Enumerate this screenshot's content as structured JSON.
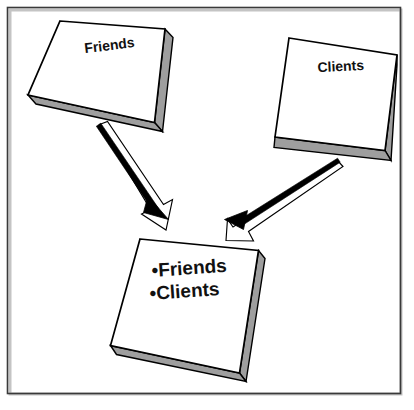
{
  "figure": {
    "type": "block-diagram",
    "title": "",
    "background_color": "#ffffff",
    "frame": {
      "name": "outer-border",
      "stroke_color": "#3a3a3a",
      "inner_shadow_color": "#bfbfbf",
      "x": 7,
      "y": 7,
      "width": 394,
      "height": 387
    },
    "style": {
      "box_face_color": "#ffffff",
      "box_side_color": "#9e9e9e",
      "box_outline_color": "#000000",
      "arrow_fill_color": "#ffffff",
      "arrow_line_color": "#000000",
      "arrowhead_color": "#000000",
      "text_color": "#111111"
    },
    "boxes": [
      {
        "id": "box-friends",
        "name": "box-friends",
        "label": "Friends",
        "label_rotation_deg": -7,
        "label_x": 110,
        "label_y": 50,
        "font_size": 14
      },
      {
        "id": "box-clients",
        "name": "box-clients",
        "label": "Clients",
        "label_rotation_deg": -3,
        "label_x": 341,
        "label_y": 70,
        "font_size": 14
      },
      {
        "id": "box-merged",
        "name": "box-merged-list",
        "label": "",
        "items": [
          "•Friends",
          "•Clients"
        ],
        "label_rotation_deg": -4,
        "items_x": 152,
        "items_y": [
          276,
          299
        ],
        "font_size": 19
      }
    ],
    "arrows": [
      {
        "id": "arrow-friends-to-merged",
        "name": "arrow-friends-to-merged",
        "from": "box-friends",
        "to": "box-merged-list",
        "direction": "down-right"
      },
      {
        "id": "arrow-clients-to-merged",
        "name": "arrow-clients-to-merged",
        "from": "box-clients",
        "to": "box-merged-list",
        "direction": "down-left"
      }
    ]
  }
}
